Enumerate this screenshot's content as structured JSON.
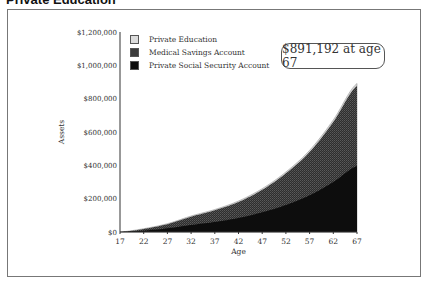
{
  "title": "Private Education",
  "callout": "$891,192 at age 67",
  "chart_data": {
    "type": "area",
    "stacked": true,
    "title": "Private Education",
    "xlabel": "Age",
    "ylabel": "Assets",
    "x": [
      17,
      22,
      27,
      32,
      37,
      42,
      47,
      52,
      57,
      62,
      67
    ],
    "ylim": [
      0,
      1200000
    ],
    "yticks": [
      "$0",
      "$200,000",
      "$400,000",
      "$600,000",
      "$800,000",
      "$1,000,000",
      "$1,200,000"
    ],
    "xticks": [
      "17",
      "22",
      "27",
      "32",
      "37",
      "42",
      "47",
      "52",
      "57",
      "62",
      "67"
    ],
    "grid": false,
    "legend_position": "top-left inside",
    "series": [
      {
        "name": "Private Social Security Account",
        "color": "#111111",
        "values": [
          0,
          8000,
          22000,
          42000,
          60000,
          84000,
          118000,
          162000,
          220000,
          300000,
          396000
        ]
      },
      {
        "name": "Medical Savings Account",
        "color": "#3a3a3a",
        "values": [
          0,
          10000,
          25000,
          50000,
          70000,
          96000,
          135000,
          190000,
          260000,
          360000,
          481192
        ]
      },
      {
        "name": "Private Education",
        "color": "#d8d8d8",
        "values": [
          0,
          2000,
          3000,
          4000,
          5000,
          6000,
          7000,
          8000,
          10000,
          12000,
          14000
        ]
      }
    ],
    "annotation": "$891,192 at age 67"
  },
  "legend": [
    {
      "label": "Private Education",
      "color": "#dcdcdc"
    },
    {
      "label": "Medical Savings Account",
      "color": "#3c3c3c"
    },
    {
      "label": "Private Social Security Account",
      "color": "#0d0d0d"
    }
  ],
  "axes": {
    "xlabel": "Age",
    "ylabel": "Assets"
  }
}
